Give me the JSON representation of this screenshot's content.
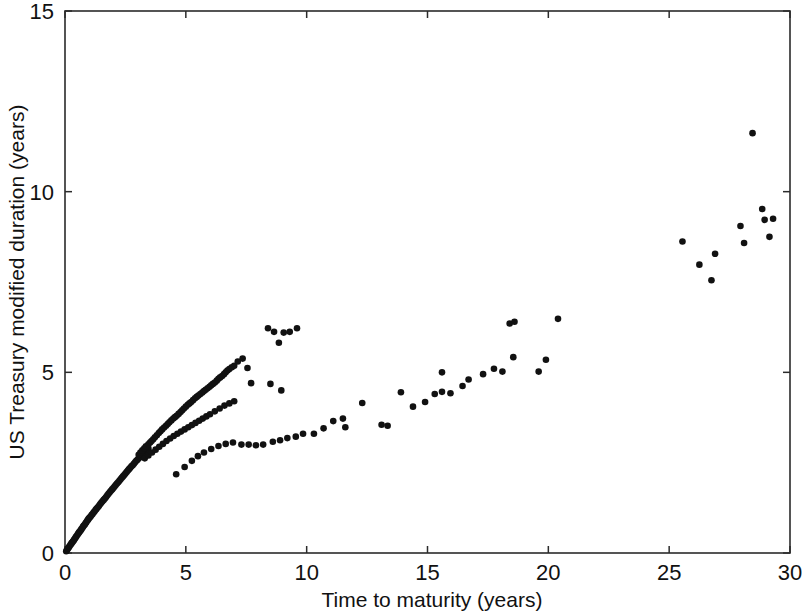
{
  "chart_data": {
    "type": "scatter",
    "title": "",
    "xlabel": "Time to maturity (years)",
    "ylabel": "US Treasury modified duration (years)",
    "xlim": [
      0,
      30
    ],
    "ylim": [
      0,
      15
    ],
    "xticks": [
      0,
      5,
      10,
      15,
      20,
      25,
      30
    ],
    "yticks": [
      0,
      5,
      10,
      15
    ],
    "xtick_labels": [
      "0",
      "5",
      "10",
      "15",
      "20",
      "25",
      "30"
    ],
    "ytick_labels": [
      "0",
      "5",
      "10",
      "15"
    ],
    "grid": false,
    "legend": null,
    "marker": "filled-circle",
    "marker_color": "#111111",
    "marker_size_px": 4.2,
    "series": [
      {
        "name": "US Treasury securities",
        "points": [
          [
            0.05,
            0.05
          ],
          [
            0.08,
            0.08
          ],
          [
            0.12,
            0.12
          ],
          [
            0.15,
            0.15
          ],
          [
            0.18,
            0.18
          ],
          [
            0.22,
            0.22
          ],
          [
            0.25,
            0.25
          ],
          [
            0.28,
            0.28
          ],
          [
            0.32,
            0.31
          ],
          [
            0.35,
            0.34
          ],
          [
            0.38,
            0.37
          ],
          [
            0.42,
            0.41
          ],
          [
            0.45,
            0.44
          ],
          [
            0.48,
            0.47
          ],
          [
            0.52,
            0.51
          ],
          [
            0.55,
            0.54
          ],
          [
            0.58,
            0.57
          ],
          [
            0.62,
            0.6
          ],
          [
            0.65,
            0.63
          ],
          [
            0.68,
            0.66
          ],
          [
            0.72,
            0.7
          ],
          [
            0.75,
            0.73
          ],
          [
            0.78,
            0.76
          ],
          [
            0.82,
            0.79
          ],
          [
            0.85,
            0.82
          ],
          [
            0.88,
            0.85
          ],
          [
            0.92,
            0.89
          ],
          [
            0.95,
            0.92
          ],
          [
            0.98,
            0.95
          ],
          [
            1.02,
            0.98
          ],
          [
            1.06,
            1.01
          ],
          [
            1.1,
            1.05
          ],
          [
            1.14,
            1.08
          ],
          [
            1.18,
            1.12
          ],
          [
            1.22,
            1.15
          ],
          [
            1.26,
            1.19
          ],
          [
            1.3,
            1.22
          ],
          [
            1.35,
            1.26
          ],
          [
            1.4,
            1.3
          ],
          [
            1.45,
            1.35
          ],
          [
            1.5,
            1.39
          ],
          [
            1.55,
            1.43
          ],
          [
            1.6,
            1.47
          ],
          [
            1.65,
            1.51
          ],
          [
            1.7,
            1.55
          ],
          [
            1.75,
            1.6
          ],
          [
            1.8,
            1.64
          ],
          [
            1.85,
            1.68
          ],
          [
            1.9,
            1.72
          ],
          [
            1.95,
            1.76
          ],
          [
            2.0,
            1.8
          ],
          [
            2.05,
            1.84
          ],
          [
            2.1,
            1.88
          ],
          [
            2.15,
            1.92
          ],
          [
            2.2,
            1.96
          ],
          [
            2.25,
            2.0
          ],
          [
            2.3,
            2.04
          ],
          [
            2.35,
            2.08
          ],
          [
            2.4,
            2.12
          ],
          [
            2.45,
            2.16
          ],
          [
            2.5,
            2.2
          ],
          [
            2.55,
            2.24
          ],
          [
            2.6,
            2.28
          ],
          [
            2.65,
            2.32
          ],
          [
            2.7,
            2.36
          ],
          [
            2.75,
            2.4
          ],
          [
            2.8,
            2.43
          ],
          [
            2.85,
            2.47
          ],
          [
            2.9,
            2.51
          ],
          [
            2.95,
            2.55
          ],
          [
            3.0,
            2.58
          ],
          [
            3.05,
            2.62
          ],
          [
            3.1,
            2.65
          ],
          [
            3.15,
            2.69
          ],
          [
            3.2,
            2.72
          ],
          [
            3.25,
            2.76
          ],
          [
            3.3,
            2.79
          ],
          [
            3.35,
            2.83
          ],
          [
            3.4,
            2.86
          ],
          [
            3.45,
            2.9
          ],
          [
            3.05,
            2.72
          ],
          [
            3.12,
            2.78
          ],
          [
            3.2,
            2.84
          ],
          [
            3.28,
            2.9
          ],
          [
            3.35,
            2.95
          ],
          [
            3.45,
            3.01
          ],
          [
            3.52,
            3.06
          ],
          [
            3.58,
            3.1
          ],
          [
            3.65,
            3.15
          ],
          [
            3.72,
            3.2
          ],
          [
            3.8,
            3.26
          ],
          [
            3.88,
            3.32
          ],
          [
            3.95,
            3.37
          ],
          [
            4.02,
            3.42
          ],
          [
            4.1,
            3.47
          ],
          [
            4.18,
            3.52
          ],
          [
            4.25,
            3.57
          ],
          [
            4.32,
            3.62
          ],
          [
            4.4,
            3.67
          ],
          [
            4.48,
            3.72
          ],
          [
            4.55,
            3.76
          ],
          [
            4.62,
            3.8
          ],
          [
            4.7,
            3.85
          ],
          [
            4.78,
            3.9
          ],
          [
            4.85,
            3.95
          ],
          [
            4.92,
            4.0
          ],
          [
            5.0,
            4.05
          ],
          [
            5.08,
            4.1
          ],
          [
            5.15,
            4.14
          ],
          [
            5.22,
            4.18
          ],
          [
            5.3,
            4.23
          ],
          [
            5.38,
            4.28
          ],
          [
            5.45,
            4.32
          ],
          [
            5.52,
            4.36
          ],
          [
            5.6,
            4.4
          ],
          [
            5.68,
            4.44
          ],
          [
            5.75,
            4.48
          ],
          [
            5.82,
            4.52
          ],
          [
            5.9,
            4.56
          ],
          [
            5.98,
            4.6
          ],
          [
            6.05,
            4.64
          ],
          [
            6.12,
            4.68
          ],
          [
            6.2,
            4.72
          ],
          [
            6.28,
            4.77
          ],
          [
            6.35,
            4.82
          ],
          [
            6.42,
            4.86
          ],
          [
            6.5,
            4.9
          ],
          [
            6.58,
            4.95
          ],
          [
            6.65,
            5.0
          ],
          [
            6.72,
            5.05
          ],
          [
            6.8,
            5.09
          ],
          [
            6.9,
            5.14
          ],
          [
            7.0,
            5.18
          ],
          [
            3.3,
            2.62
          ],
          [
            3.45,
            2.7
          ],
          [
            3.6,
            2.78
          ],
          [
            3.75,
            2.86
          ],
          [
            3.9,
            2.94
          ],
          [
            4.05,
            3.02
          ],
          [
            4.2,
            3.1
          ],
          [
            4.35,
            3.17
          ],
          [
            4.5,
            3.24
          ],
          [
            4.65,
            3.3
          ],
          [
            4.8,
            3.36
          ],
          [
            4.95,
            3.42
          ],
          [
            5.1,
            3.48
          ],
          [
            5.25,
            3.54
          ],
          [
            5.4,
            3.6
          ],
          [
            5.55,
            3.66
          ],
          [
            5.7,
            3.72
          ],
          [
            5.85,
            3.78
          ],
          [
            6.0,
            3.84
          ],
          [
            6.2,
            3.92
          ],
          [
            6.4,
            4.0
          ],
          [
            6.6,
            4.08
          ],
          [
            6.8,
            4.14
          ],
          [
            7.0,
            4.2
          ],
          [
            4.6,
            2.18
          ],
          [
            4.95,
            2.38
          ],
          [
            5.25,
            2.55
          ],
          [
            5.5,
            2.68
          ],
          [
            5.75,
            2.78
          ],
          [
            6.05,
            2.88
          ],
          [
            6.35,
            2.96
          ],
          [
            6.65,
            3.02
          ],
          [
            6.95,
            3.06
          ],
          [
            7.15,
            5.3
          ],
          [
            7.35,
            5.38
          ],
          [
            7.55,
            5.12
          ],
          [
            7.7,
            4.7
          ],
          [
            7.3,
            3.0
          ],
          [
            7.6,
            3.0
          ],
          [
            7.9,
            2.98
          ],
          [
            8.2,
            3.0
          ],
          [
            8.4,
            6.22
          ],
          [
            8.65,
            6.12
          ],
          [
            8.85,
            5.82
          ],
          [
            9.05,
            6.1
          ],
          [
            9.3,
            6.12
          ],
          [
            9.6,
            6.22
          ],
          [
            8.5,
            4.68
          ],
          [
            8.95,
            4.5
          ],
          [
            8.6,
            3.08
          ],
          [
            8.9,
            3.12
          ],
          [
            9.2,
            3.18
          ],
          [
            9.55,
            3.22
          ],
          [
            9.85,
            3.3
          ],
          [
            10.3,
            3.3
          ],
          [
            10.7,
            3.45
          ],
          [
            11.1,
            3.65
          ],
          [
            11.5,
            3.72
          ],
          [
            11.6,
            3.48
          ],
          [
            12.3,
            4.15
          ],
          [
            13.1,
            3.55
          ],
          [
            13.35,
            3.52
          ],
          [
            13.9,
            4.45
          ],
          [
            14.4,
            4.05
          ],
          [
            14.9,
            4.18
          ],
          [
            15.6,
            5.0
          ],
          [
            15.3,
            4.4
          ],
          [
            15.6,
            4.46
          ],
          [
            15.95,
            4.42
          ],
          [
            16.45,
            4.62
          ],
          [
            16.7,
            4.8
          ],
          [
            17.3,
            4.95
          ],
          [
            17.75,
            5.1
          ],
          [
            18.1,
            5.02
          ],
          [
            18.4,
            6.35
          ],
          [
            18.6,
            6.4
          ],
          [
            18.55,
            5.42
          ],
          [
            19.6,
            5.02
          ],
          [
            19.9,
            5.35
          ],
          [
            20.4,
            6.48
          ],
          [
            25.55,
            8.62
          ],
          [
            26.25,
            7.98
          ],
          [
            26.75,
            7.55
          ],
          [
            26.9,
            8.28
          ],
          [
            27.95,
            9.05
          ],
          [
            28.1,
            8.58
          ],
          [
            28.45,
            11.62
          ],
          [
            28.85,
            9.52
          ],
          [
            28.95,
            9.22
          ],
          [
            29.3,
            9.25
          ],
          [
            29.15,
            8.75
          ]
        ]
      }
    ]
  }
}
